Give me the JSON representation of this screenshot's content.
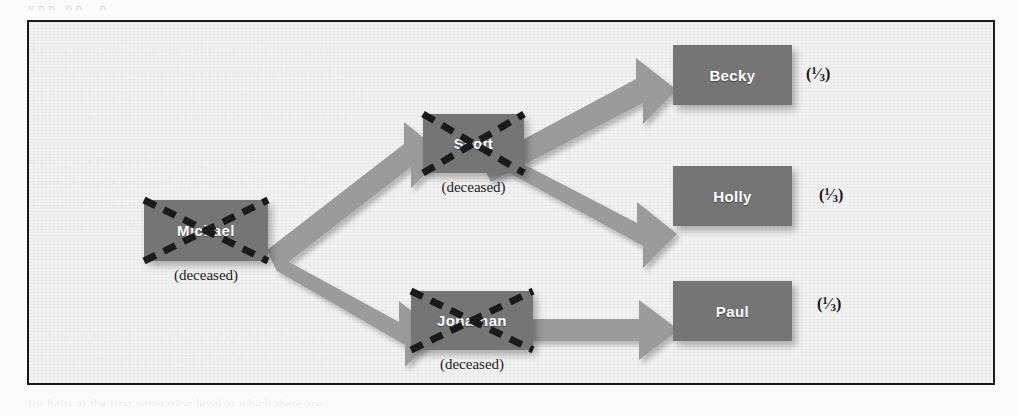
{
  "page": {
    "background_color": "#fbfbfb",
    "frame_color": "#1a1a1a",
    "node_color": "#757575",
    "arrow_color": "#9a9a9a",
    "strike_color": "#1a1a1a",
    "node_text_color": "#ffffff"
  },
  "ghost_text": {
    "top": "y p p , p p , , p ,",
    "lines": [
      "that are not  a  and who  might  of his estate  his heirs  would",
      "these  children  and  the  remaining two  grandchildren  each  take",
      "Michael  is  not  a  survivor  of  the  decedent  and only  those  in  the",
      "next  generation  who  survive  take  the  share  that  would  have",
      "",
      "predeceases  the  decedent  leaving  issue  who  survive  the",
      "decedent, that  share  passes  to  the  issue  by  representation",
      "in  the  manner  described  above,  the  per  capita  at  each",
      "generation  approach  divides  the  estate  into  equal  shares",
      "",
      "for  heirs  at  the  first  generation  level  at  which  there  are",
      "surviving  members  and  the  remainder  passes  down  to  the"
    ]
  },
  "diagram": {
    "type": "family-inheritance-tree",
    "nodes": [
      {
        "id": "michael",
        "label": "Michael",
        "deceased": true,
        "deceased_label": "(deceased)",
        "share": null,
        "generation": 1
      },
      {
        "id": "scott",
        "label": "Scott",
        "deceased": true,
        "deceased_label": "(deceased)",
        "share": null,
        "generation": 2
      },
      {
        "id": "jonathan",
        "label": "Jonathan",
        "deceased": true,
        "deceased_label": "(deceased)",
        "share": null,
        "generation": 2
      },
      {
        "id": "becky",
        "label": "Becky",
        "deceased": false,
        "deceased_label": null,
        "share_num": "1",
        "share_den": "3",
        "generation": 3
      },
      {
        "id": "holly",
        "label": "Holly",
        "deceased": false,
        "deceased_label": null,
        "share_num": "1",
        "share_den": "3",
        "generation": 3
      },
      {
        "id": "paul",
        "label": "Paul",
        "deceased": false,
        "deceased_label": null,
        "share_num": "1",
        "share_den": "3",
        "generation": 3
      }
    ],
    "edges": [
      {
        "from": "michael",
        "to": "scott",
        "direction": "up-right"
      },
      {
        "from": "michael",
        "to": "jonathan",
        "direction": "down-right"
      },
      {
        "from": "scott",
        "to": "becky",
        "direction": "up-right"
      },
      {
        "from": "scott",
        "to": "holly",
        "direction": "down-right"
      },
      {
        "from": "jonathan",
        "to": "paul",
        "direction": "right"
      }
    ]
  }
}
